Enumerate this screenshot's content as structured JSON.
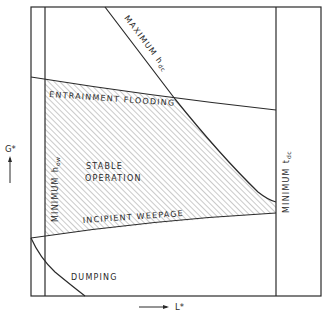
{
  "diagram": {
    "type": "tray operating window",
    "axes": {
      "x_label": "L*",
      "y_label": "G*"
    },
    "regions": {
      "stable": "STABLE",
      "stable2": "OPERATION",
      "dumping": "DUMPING"
    },
    "boundaries": {
      "flooding": "ENTRAINMENT FLOODING",
      "weepage": "INCIPIENT WEEPAGE",
      "max_hdc": "MAXIMUM",
      "max_hdc_sub": "h",
      "max_hdc_subscript": "dc",
      "min_how": "MINIMUM",
      "min_how_sub": "h",
      "min_how_subscript": "ow",
      "min_tdc": "MINIMUM",
      "min_tdc_sub": "t",
      "min_tdc_subscript": "dc"
    },
    "colors": {
      "line": "#2a2a2a",
      "hatch": "#8a8a8a",
      "background": "#ffffff"
    }
  }
}
